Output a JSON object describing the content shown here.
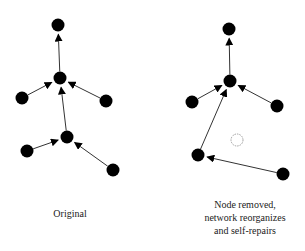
{
  "captions": {
    "left": "Original",
    "right_line1": "Node removed,",
    "right_line2": "network reorganizes",
    "right_line3": "and self-repairs"
  },
  "colors": {
    "node": "#000000",
    "edge": "#333333",
    "removed_node_stroke": "#888888"
  },
  "diagrams": {
    "original": {
      "nodes": [
        {
          "id": "top",
          "x": 58,
          "y": 25
        },
        {
          "id": "mid",
          "x": 60,
          "y": 78
        },
        {
          "id": "left",
          "x": 22,
          "y": 98
        },
        {
          "id": "right",
          "x": 106,
          "y": 101
        },
        {
          "id": "lower",
          "x": 67,
          "y": 137
        },
        {
          "id": "lower_left",
          "x": 27,
          "y": 151
        },
        {
          "id": "lower_right",
          "x": 113,
          "y": 170
        }
      ],
      "edges": [
        [
          "mid",
          "top"
        ],
        [
          "left",
          "mid"
        ],
        [
          "right",
          "mid"
        ],
        [
          "lower",
          "mid"
        ],
        [
          "lower_left",
          "lower"
        ],
        [
          "lower_right",
          "lower"
        ]
      ]
    },
    "repaired": {
      "nodes": [
        {
          "id": "top",
          "x": 229,
          "y": 29
        },
        {
          "id": "mid",
          "x": 230,
          "y": 81
        },
        {
          "id": "left",
          "x": 192,
          "y": 102
        },
        {
          "id": "right",
          "x": 277,
          "y": 106
        },
        {
          "id": "lower_left",
          "x": 198,
          "y": 155
        },
        {
          "id": "lower_right",
          "x": 283,
          "y": 174
        }
      ],
      "removed_node": {
        "x": 237,
        "y": 140
      },
      "edges": [
        [
          "mid",
          "top"
        ],
        [
          "left",
          "mid"
        ],
        [
          "right",
          "mid"
        ],
        [
          "lower_left",
          "mid"
        ],
        [
          "lower_right",
          "lower_left"
        ]
      ]
    }
  }
}
